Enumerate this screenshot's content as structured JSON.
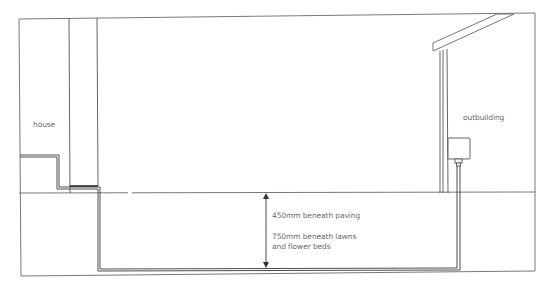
{
  "diagram": {
    "type": "cross-section illustration",
    "labels": {
      "house": "house",
      "outbuilding": "outbuilding",
      "depth_paving": "450mm beneath paving",
      "depth_lawns_line1": "750mm beneath lawns",
      "depth_lawns_line2": "and flower beds"
    },
    "colors": {
      "line": "#555555",
      "pipe": "#3a3a3a",
      "text": "#6a6a6a",
      "background": "#ffffff"
    }
  }
}
